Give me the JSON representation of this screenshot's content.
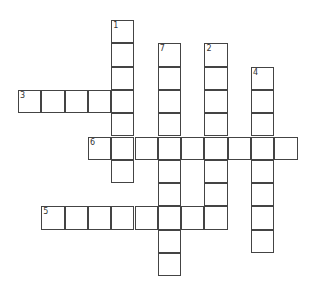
{
  "puzzle": {
    "type": "crossword",
    "cell_size": 23.3,
    "origin": {
      "x": 18,
      "y": 20
    },
    "border_color": "#444444",
    "background": "#ffffff",
    "words": [
      {
        "number": "1",
        "direction": "down",
        "row": 0,
        "col": 4,
        "length": 7
      },
      {
        "number": "7",
        "direction": "down",
        "row": 1,
        "col": 6,
        "length": 10
      },
      {
        "number": "2",
        "direction": "down",
        "row": 1,
        "col": 8,
        "length": 8
      },
      {
        "number": "4",
        "direction": "down",
        "row": 2,
        "col": 10,
        "length": 8
      },
      {
        "number": "3",
        "direction": "across",
        "row": 3,
        "col": 0,
        "length": 5
      },
      {
        "number": "6",
        "direction": "across",
        "row": 5,
        "col": 3,
        "length": 9
      },
      {
        "number": "5",
        "direction": "across",
        "row": 8,
        "col": 1,
        "length": 8
      }
    ]
  }
}
